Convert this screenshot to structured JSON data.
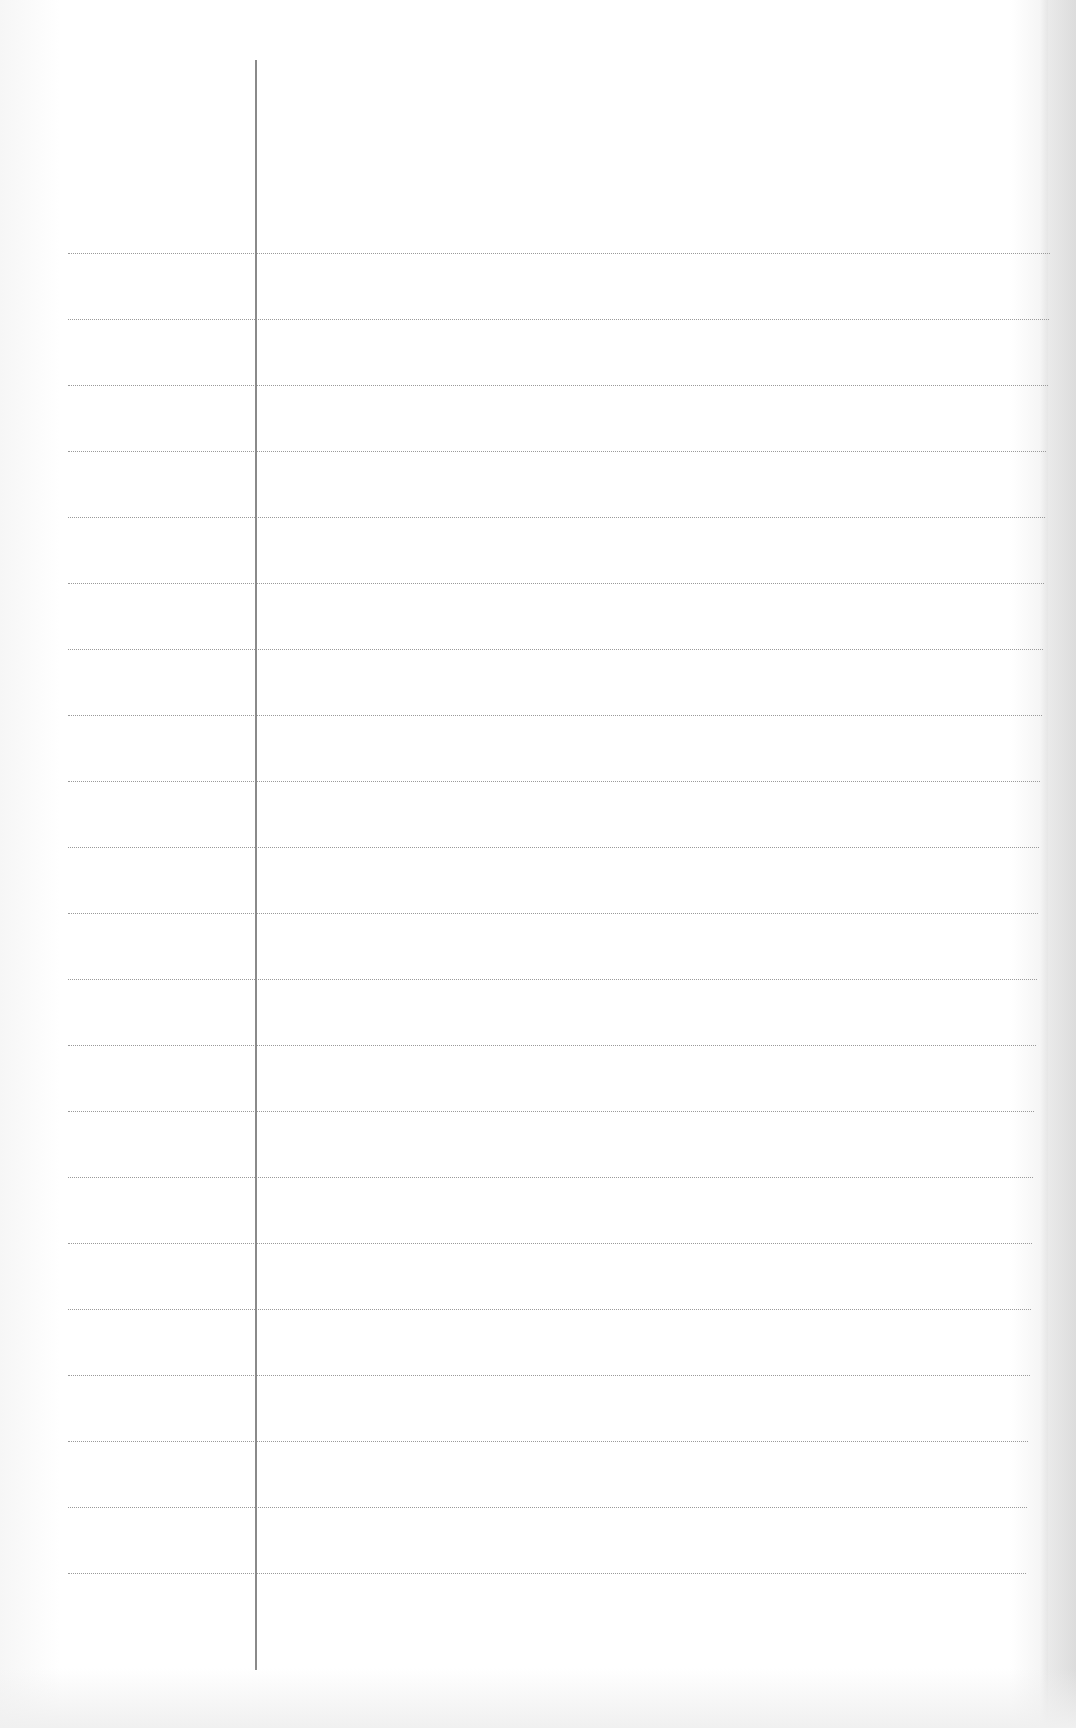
{
  "page": {
    "type": "blank lined paper",
    "text_content": "",
    "colors": {
      "paper": "#ffffff",
      "ruled_line": "#9a9a9a",
      "margin_line": "#8a8a8a"
    },
    "margin_line": {
      "x": 255,
      "top": 60,
      "bottom": 1670
    },
    "ruled_lines": {
      "count": 21,
      "first_y": 253,
      "spacing": 66,
      "left": 68,
      "right": 1050
    }
  }
}
